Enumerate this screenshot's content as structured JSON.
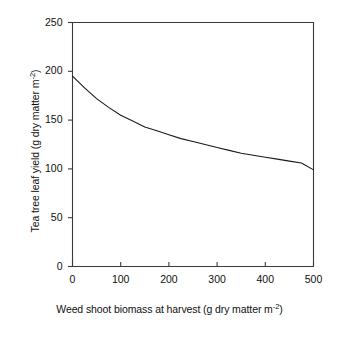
{
  "chart_data": {
    "type": "line",
    "title": "",
    "xlabel_plain": "Weed shoot biomass at harvest (g dry matter m-2)",
    "ylabel_plain": "Tea tree leaf yield (g dry matter m-2)",
    "xlabel_parts": {
      "main": "Weed shoot biomass at harvest (g dry matter m",
      "sup": "-2",
      "tail": ")"
    },
    "ylabel_parts": {
      "main": "Tea tree leaf yield (g dry matter m",
      "sup": "-2",
      "tail": ")"
    },
    "xlim": [
      0,
      500
    ],
    "ylim": [
      0,
      250
    ],
    "xticks": [
      0,
      100,
      200,
      300,
      400,
      500
    ],
    "yticks": [
      0,
      50,
      100,
      150,
      200,
      250
    ],
    "xtick_labels": [
      "0",
      "100",
      "200",
      "300",
      "400",
      "500"
    ],
    "ytick_labels": [
      "0",
      "50",
      "100",
      "150",
      "200",
      "250"
    ],
    "grid": false,
    "legend": null,
    "series": [
      {
        "name": "Tea tree leaf yield response",
        "color": "#1a1a1a",
        "linewidth": 1,
        "x": [
          0,
          25,
          50,
          75,
          100,
          125,
          150,
          175,
          200,
          225,
          250,
          275,
          300,
          325,
          350,
          375,
          400,
          425,
          450,
          475,
          500
        ],
        "y": [
          195,
          183,
          172,
          163,
          155,
          149,
          143,
          139,
          135,
          131,
          128,
          125,
          122,
          119,
          116,
          114,
          112,
          110,
          108,
          106,
          99
        ]
      }
    ],
    "annotations": []
  },
  "tick_labels": {
    "y": [
      "250",
      "200",
      "150",
      "100",
      "50",
      "0"
    ],
    "x": [
      "0",
      "100",
      "200",
      "300",
      "400",
      "500"
    ]
  }
}
